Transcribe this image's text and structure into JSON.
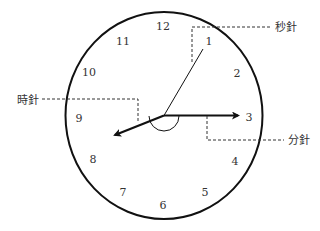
{
  "diagram": {
    "type": "analog-clock",
    "colors": {
      "stroke": "#111111",
      "text": "#333333",
      "dashed": "#333333",
      "background": "#ffffff"
    },
    "face": {
      "cx": 164,
      "cy": 115.5,
      "rx": 98.5,
      "ry": 103.5
    },
    "numbers": [
      {
        "label": "12",
        "x": 163,
        "y": 30
      },
      {
        "label": "1",
        "x": 209,
        "y": 45
      },
      {
        "label": "2",
        "x": 237,
        "y": 77
      },
      {
        "label": "3",
        "x": 249,
        "y": 121
      },
      {
        "label": "4",
        "x": 235,
        "y": 165
      },
      {
        "label": "5",
        "x": 205,
        "y": 196
      },
      {
        "label": "6",
        "x": 163,
        "y": 209
      },
      {
        "label": "7",
        "x": 123,
        "y": 196
      },
      {
        "label": "8",
        "x": 93,
        "y": 163
      },
      {
        "label": "9",
        "x": 79,
        "y": 122
      },
      {
        "label": "10",
        "x": 89,
        "y": 76
      },
      {
        "label": "11",
        "x": 123,
        "y": 45
      }
    ],
    "hands": {
      "second": {
        "label": "秒針",
        "x2": 203,
        "y2": 49
      },
      "minute": {
        "label": "分針",
        "x2": 240,
        "y2": 115.5
      },
      "hour": {
        "label": "時針",
        "x2": 113,
        "y2": 136
      }
    },
    "callouts": [
      {
        "name": "second-hand-label",
        "text": "秒針",
        "x": 275,
        "y": 31
      },
      {
        "name": "hour-hand-label",
        "text": "時針",
        "x": 17,
        "y": 104
      },
      {
        "name": "minute-hand-label",
        "text": "分針",
        "x": 288,
        "y": 144
      }
    ]
  }
}
